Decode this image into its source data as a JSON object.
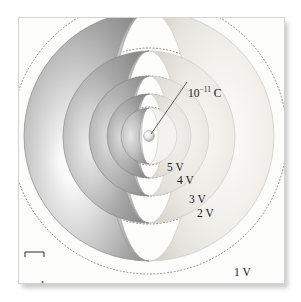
{
  "figure": {
    "type": "physics-diagram",
    "charge_label": "10",
    "charge_exponent": "−11",
    "charge_unit": " C",
    "charge_label_full": "10⁻¹¹ C",
    "equipotentials": [
      {
        "id": "v5",
        "label": "5 V",
        "volts": 5
      },
      {
        "id": "v4",
        "label": "4 V",
        "volts": 4
      },
      {
        "id": "v3",
        "label": "3 V",
        "volts": 3
      },
      {
        "id": "v2",
        "label": "2 V",
        "volts": 2
      },
      {
        "id": "v1",
        "label": "1 V",
        "volts": 1
      }
    ],
    "scale": {
      "label": "1 cm"
    },
    "colors": {
      "panel_background": "#fcfcfb",
      "panel_border": "#d3d3d3",
      "shell_dark": "#8e8e8e",
      "shell_mid": "#bdbdbd",
      "shell_light": "#ededed",
      "cut_face": "#f3f2ee",
      "dotted_contour": "#7d7d7d",
      "label_text": "#1a1a1a",
      "highlight": "#ffffff"
    }
  }
}
